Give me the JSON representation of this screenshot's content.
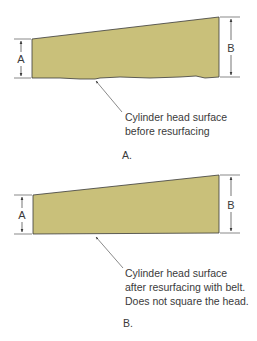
{
  "colors": {
    "surface_fill": "#c9c07a",
    "surface_stroke": "#3a3a3a",
    "line": "#3a3a3a",
    "background": "#ffffff"
  },
  "panels": [
    {
      "id": "A",
      "label": "A.",
      "dimension_left": "A",
      "dimension_right": "B",
      "caption_lines": [
        "Cylinder head surface",
        "before resurfacing"
      ]
    },
    {
      "id": "B",
      "label": "B.",
      "dimension_left": "A",
      "dimension_right": "B",
      "caption_lines": [
        "Cylinder head surface",
        "after resurfacing with belt.",
        "Does not square the head."
      ]
    }
  ]
}
